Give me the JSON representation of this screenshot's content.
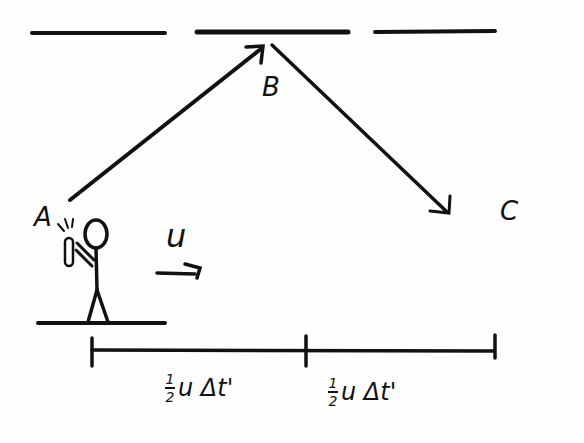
{
  "diagram": {
    "points": {
      "A": "A",
      "B": "B",
      "C": "C"
    },
    "velocity_label": "u",
    "segments": [
      {
        "numerator": "1",
        "denominator": "2",
        "expr": "u Δt'"
      },
      {
        "numerator": "1",
        "denominator": "2",
        "expr": "u Δt'"
      }
    ],
    "elements": {
      "mirror": "mirror (top, three segments)",
      "ground": "ground platform under observer",
      "observer": "stick figure holding light source",
      "ray_AB": "light ray A to B",
      "ray_BC": "light ray B to C",
      "velocity_arrow": "arrow indicating motion to the right",
      "distance_bar": "distance scale with two equal halves"
    },
    "colors": {
      "ink": "#111111",
      "background": "#fefefe"
    }
  }
}
